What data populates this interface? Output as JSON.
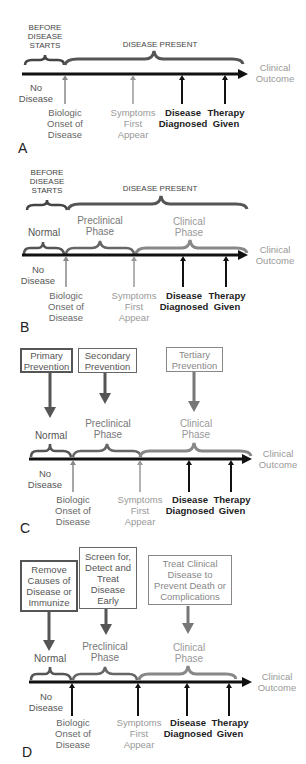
{
  "colors": {
    "axis": "#111111",
    "normal_brace": "#555555",
    "preclinical_brace": "#666666",
    "clinical_brace": "#888888",
    "dark_text": "#222222",
    "mid_text": "#666666",
    "light_text": "#999999"
  },
  "common": {
    "outcome_label": "Clinical\nOutcome",
    "no_disease": "No\nDisease",
    "markers": {
      "onset": "Biologic\nOnset of\nDisease",
      "symptoms": "Symptoms\nFirst\nAppear",
      "diagnosed": "Disease\nDiagnosed",
      "therapy": "Therapy\nGiven"
    }
  },
  "panels": {
    "A": {
      "letter": "A",
      "before_label": "BEFORE\nDISEASE\nSTARTS",
      "present_label": "DISEASE PRESENT"
    },
    "B": {
      "letter": "B",
      "before_label": "BEFORE\nDISEASE\nSTARTS",
      "present_label": "DISEASE PRESENT",
      "phases": {
        "normal": "Normal",
        "preclinical": "Preclinical\nPhase",
        "clinical": "Clinical\nPhase"
      }
    },
    "C": {
      "letter": "C",
      "boxes": {
        "primary": "Primary\nPrevention",
        "secondary": "Secondary\nPrevention",
        "tertiary": "Tertiary\nPrevention"
      },
      "phases": {
        "normal": "Normal",
        "preclinical": "Preclinical\nPhase",
        "clinical": "Clinical\nPhase"
      }
    },
    "D": {
      "letter": "D",
      "boxes": {
        "primary": "Remove\nCauses of\nDisease or\nImmunize",
        "secondary": "Screen for,\nDetect and\nTreat\nDisease\nEarly",
        "tertiary": "Treat Clinical\nDisease to\nPrevent Death or\nComplications"
      },
      "phases": {
        "normal": "Normal",
        "preclinical": "Preclinical\nPhase",
        "clinical": "Clinical\nPhase"
      }
    }
  }
}
